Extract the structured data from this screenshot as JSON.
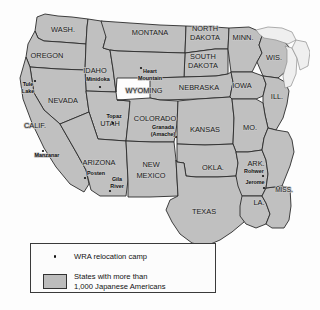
{
  "map": {
    "title": "WRA relocation camps and states with more than 1,000 Japanese Americans",
    "colors": {
      "background": "#fdfdfd",
      "state_fill": "#c0c0c0",
      "state_border": "#2b2b2b",
      "lake_fill": "#efefef",
      "legend_swatch": "#bdbdbd",
      "label_text": "#111111"
    },
    "states": [
      {
        "name": "WASH.",
        "x": 63,
        "y": 30,
        "size": "normal"
      },
      {
        "name": "OREGON",
        "x": 47,
        "y": 56,
        "size": "normal"
      },
      {
        "name": "IDAHO",
        "x": 95,
        "y": 71,
        "size": "normal"
      },
      {
        "name": "MONTANA",
        "x": 150,
        "y": 33,
        "size": "normal"
      },
      {
        "name": "NORTH",
        "x": 205,
        "y": 29,
        "size": "normal"
      },
      {
        "name": "DAKOTA",
        "x": 205,
        "y": 38,
        "size": "normal"
      },
      {
        "name": "SOUTH",
        "x": 203,
        "y": 57,
        "size": "normal"
      },
      {
        "name": "DAKOTA",
        "x": 203,
        "y": 66,
        "size": "normal"
      },
      {
        "name": "MINN.",
        "x": 243,
        "y": 38,
        "size": "normal"
      },
      {
        "name": "WIS.",
        "x": 274,
        "y": 58,
        "size": "normal"
      },
      {
        "name": "WYOMING",
        "x": 144,
        "y": 91,
        "size": "normal"
      },
      {
        "name": "NEBRASKA",
        "x": 199,
        "y": 88,
        "size": "normal"
      },
      {
        "name": "IOWA",
        "x": 242,
        "y": 86,
        "size": "normal"
      },
      {
        "name": "ILL.",
        "x": 277,
        "y": 97,
        "size": "normal"
      },
      {
        "name": "NEVADA",
        "x": 63,
        "y": 101,
        "size": "normal"
      },
      {
        "name": "UTAH",
        "x": 110,
        "y": 124,
        "size": "normal"
      },
      {
        "name": "COLORADO",
        "x": 155,
        "y": 119,
        "size": "normal"
      },
      {
        "name": "KANSAS",
        "x": 205,
        "y": 130,
        "size": "normal"
      },
      {
        "name": "MO.",
        "x": 250,
        "y": 128,
        "size": "normal"
      },
      {
        "name": "CALIF.",
        "x": 35,
        "y": 126,
        "size": "normal"
      },
      {
        "name": "ARIZONA",
        "x": 99,
        "y": 163,
        "size": "normal"
      },
      {
        "name": "NEW",
        "x": 151,
        "y": 165,
        "size": "normal"
      },
      {
        "name": "MEXICO",
        "x": 151,
        "y": 176,
        "size": "normal"
      },
      {
        "name": "OKLA.",
        "x": 213,
        "y": 168,
        "size": "normal"
      },
      {
        "name": "ARK.",
        "x": 256,
        "y": 164,
        "size": "normal"
      },
      {
        "name": "MISS.",
        "x": 284,
        "y": 190,
        "size": "normal"
      },
      {
        "name": "LA.",
        "x": 259,
        "y": 203,
        "size": "normal"
      },
      {
        "name": "TEXAS",
        "x": 204,
        "y": 212,
        "size": "normal"
      }
    ],
    "camps": [
      {
        "name": "Tule",
        "name2": "Lake",
        "label_x": 28,
        "label_y": 85,
        "dot_x": 35,
        "dot_y": 81
      },
      {
        "name": "Minidoka",
        "name2": "",
        "label_x": 98,
        "label_y": 80,
        "dot_x": 100,
        "dot_y": 87
      },
      {
        "name": "Heart",
        "name2": "Mountain",
        "label_x": 150,
        "label_y": 76,
        "dot_x": 141,
        "dot_y": 68
      },
      {
        "name": "Topaz",
        "name2": "",
        "label_x": 114,
        "label_y": 117,
        "dot_x": 113,
        "dot_y": 123
      },
      {
        "name": "Granada",
        "name2": "(Amache)",
        "label_x": 163,
        "label_y": 131,
        "dot_x": 176,
        "dot_y": 137
      },
      {
        "name": "Manzanar",
        "name2": "",
        "label_x": 47,
        "label_y": 156,
        "dot_x": 43,
        "dot_y": 151
      },
      {
        "name": "Posten",
        "name2": "",
        "label_x": 96,
        "label_y": 174,
        "dot_x": 85,
        "dot_y": 178
      },
      {
        "name": "Gila",
        "name2": "River",
        "label_x": 117,
        "label_y": 183,
        "dot_x": 110,
        "dot_y": 191
      },
      {
        "name": "Rohwer",
        "name2": "",
        "label_x": 254,
        "label_y": 172,
        "dot_x": 263,
        "dot_y": 176
      },
      {
        "name": "Jerome",
        "name2": "",
        "label_x": 255,
        "label_y": 183,
        "dot_x": 264,
        "dot_y": 188
      }
    ]
  },
  "legend": {
    "camp_label": "WRA relocation camp",
    "states_label_line1": "States with more than",
    "states_label_line2": "1,000 Japanese Americans"
  }
}
